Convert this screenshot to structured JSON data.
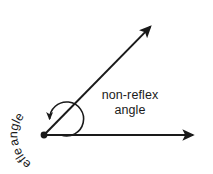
{
  "figure": {
    "title_absent": true,
    "background_color": "#ffffff",
    "ink_color": "#1a1a1a",
    "labels": {
      "non_reflex_line1": "non-reflex",
      "non_reflex_line2": "angle",
      "reflex_word_1": "reflex",
      "reflex_word_2": "angle",
      "reflex_full": "reflex angle"
    },
    "geometry": {
      "vertex_x": 44,
      "vertex_y": 135,
      "vertex_dot_radius": 3.4,
      "horizontal_ray": {
        "from_x": 44,
        "from_y": 135,
        "to_x": 199,
        "to_y": 135,
        "arrowhead": "right"
      },
      "diagonal_ray": {
        "from_x": 44,
        "from_y": 135,
        "to_x": 155,
        "to_y": 22,
        "arrowhead": "up-right",
        "angle_degrees": 45.5
      },
      "reflex_arc": {
        "radius": 17,
        "sweep": "counterclockwise",
        "start_degrees": 0,
        "end_degrees": 314,
        "arrowhead": "at-diagonal-ray"
      },
      "text_arc_radius": 27
    }
  }
}
